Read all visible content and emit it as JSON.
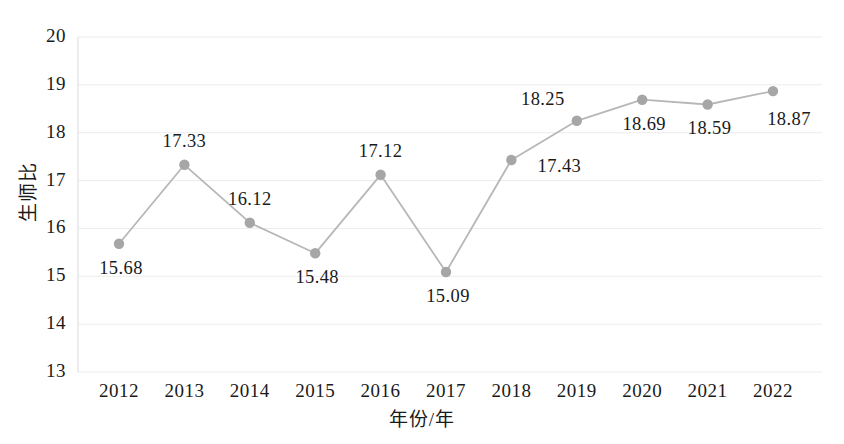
{
  "chart_data": {
    "type": "line",
    "title": "",
    "xlabel": "年份/年",
    "ylabel": "生师比",
    "categories": [
      "2012",
      "2013",
      "2014",
      "2015",
      "2016",
      "2017",
      "2018",
      "2019",
      "2020",
      "2021",
      "2022"
    ],
    "values": [
      15.68,
      17.33,
      16.12,
      15.48,
      17.12,
      15.09,
      17.43,
      18.25,
      18.69,
      18.59,
      18.87
    ],
    "point_labels": [
      "15.68",
      "17.33",
      "16.12",
      "15.48",
      "17.12",
      "15.09",
      "17.43",
      "18.25",
      "18.69",
      "18.59",
      "18.87"
    ],
    "label_positions": [
      "below",
      "above",
      "above",
      "below",
      "above",
      "below",
      "right",
      "above-left",
      "below",
      "below",
      "below-right"
    ],
    "ylim": [
      13,
      20
    ],
    "yticks": [
      13,
      14,
      15,
      16,
      17,
      18,
      19,
      20
    ],
    "ytick_labels": [
      "13",
      "14",
      "15",
      "16",
      "17",
      "18",
      "19",
      "20"
    ],
    "grid": true,
    "grid_axis": "y",
    "legend": "none",
    "series_name": "生师比",
    "colors": {
      "line": "#b7b7b7",
      "marker": "#a6a6a6",
      "grid": "#ececec",
      "axis": "#d9d9d9",
      "text": "#1a1a1a",
      "background": "#ffffff"
    }
  }
}
